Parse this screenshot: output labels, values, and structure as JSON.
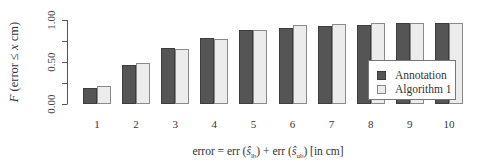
{
  "chart_data": {
    "type": "bar",
    "title": "",
    "xlabel": "error = err (ŝ_lb) + err (ŝ_ub)  [in cm]",
    "ylabel": "F (error ≤ x cm)",
    "ylim": [
      0,
      1
    ],
    "yticks": [
      0,
      0.25,
      0.5,
      0.75,
      1.0
    ],
    "ytick_labels": [
      "0.00",
      "0.50",
      "1.00"
    ],
    "categories": [
      "1",
      "2",
      "3",
      "4",
      "5",
      "6",
      "7",
      "8",
      "9",
      "10"
    ],
    "series": [
      {
        "name": "Annotation",
        "color": "#555555",
        "values": [
          0.19,
          0.47,
          0.67,
          0.79,
          0.88,
          0.91,
          0.93,
          0.94,
          0.96,
          0.97
        ]
      },
      {
        "name": "Algorithm 1",
        "color": "#ececec",
        "values": [
          0.21,
          0.49,
          0.65,
          0.77,
          0.88,
          0.94,
          0.95,
          0.96,
          0.96,
          0.97
        ]
      }
    ],
    "grid": false,
    "legend_position": "inside lower right"
  },
  "labels": {
    "ylabel_prefix": "F",
    "ylabel_rest": " (error ≤ ",
    "ylabel_var": "x",
    "ylabel_suffix": " cm)",
    "xlabel_a": "error = err (",
    "xlabel_s1": "ŝ",
    "xlabel_sub1": "lb",
    "xlabel_b": ") + err (",
    "xlabel_s2": "ŝ",
    "xlabel_sub2": "ub",
    "xlabel_c": ")  [in cm]"
  },
  "legend": {
    "items": [
      {
        "label": "Annotation"
      },
      {
        "label": "Algorithm 1"
      }
    ]
  }
}
